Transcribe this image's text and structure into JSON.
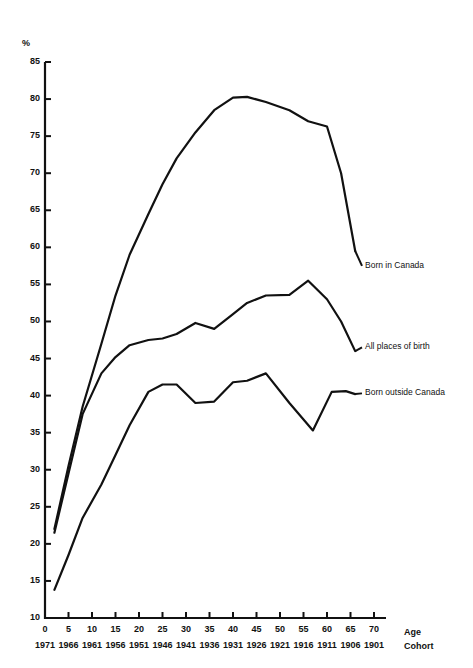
{
  "chart_data": {
    "type": "line",
    "title": "",
    "xlabel": "Age",
    "xlabel2": "Cohort",
    "ylabel": "%",
    "ylim": [
      10,
      85
    ],
    "ytick_step": 5,
    "yticks": [
      85,
      80,
      75,
      70,
      65,
      60,
      55,
      50,
      45,
      40,
      35,
      30,
      25,
      20,
      15,
      10
    ],
    "xlim": [
      0,
      70
    ],
    "xticks_age": [
      0,
      5,
      10,
      15,
      20,
      25,
      30,
      35,
      40,
      45,
      50,
      55,
      60,
      65,
      70
    ],
    "xticks_cohort": [
      1971,
      1966,
      1961,
      1956,
      1951,
      1946,
      1941,
      1936,
      1931,
      1926,
      1921,
      1916,
      1911,
      1906,
      1901
    ],
    "grid": false,
    "legend_position": "right-inline-labels",
    "series": [
      {
        "name": "Born in Canada",
        "label_x": 70,
        "label_y": 57.5,
        "x": [
          2,
          5,
          8,
          12,
          15,
          18,
          22,
          25,
          28,
          32,
          36,
          40,
          43,
          47,
          52,
          56,
          60,
          63,
          66
        ],
        "y": [
          22.0,
          30.5,
          38.5,
          47.0,
          53.5,
          59.0,
          64.5,
          68.5,
          72.0,
          75.5,
          78.5,
          80.2,
          80.3,
          79.6,
          78.5,
          77.0,
          76.3,
          70.0,
          59.5
        ]
      },
      {
        "name": "All places of birth",
        "label_x": 70,
        "label_y": 46.5,
        "x": [
          2,
          5,
          8,
          12,
          15,
          18,
          22,
          25,
          28,
          32,
          36,
          40,
          43,
          47,
          52,
          56,
          60,
          63,
          66
        ],
        "y": [
          21.5,
          29.5,
          37.5,
          43.0,
          45.2,
          46.8,
          47.5,
          47.7,
          48.3,
          49.8,
          49.0,
          51.0,
          52.5,
          53.5,
          53.6,
          55.5,
          53.0,
          50.0,
          46.0
        ]
      },
      {
        "name": "Born outside Canada",
        "label_x": 70,
        "label_y": 40.3,
        "x": [
          2,
          5,
          8,
          12,
          15,
          18,
          22,
          25,
          28,
          32,
          36,
          40,
          43,
          47,
          52,
          57,
          61,
          64,
          66
        ],
        "y": [
          13.8,
          18.5,
          23.5,
          28.0,
          32.0,
          36.0,
          40.5,
          41.5,
          41.5,
          39.0,
          39.2,
          41.8,
          42.0,
          43.0,
          39.0,
          35.3,
          40.5,
          40.6,
          40.2
        ]
      }
    ]
  },
  "axis": {
    "percent_symbol": "%",
    "age_label": "Age",
    "cohort_label": "Cohort"
  }
}
